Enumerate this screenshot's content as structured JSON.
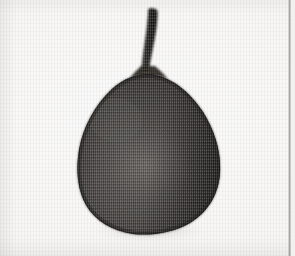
{
  "image": {
    "kind": "scanned-halftone-photograph",
    "subject": "pear-shaped-fruit-with-stem",
    "orientation": "portrait",
    "width_px": 295,
    "height_px": 256,
    "caption": "",
    "alt_text": "Dark pear-shaped fruit with a long curved stem, photographed against a plain pale background",
    "visible_text": []
  },
  "palette": {
    "paper_light": "#fbfafa",
    "paper_mid": "#f2f1ef",
    "paper_shadow": "#e6e5e3",
    "fruit_dark": "#2e2c2a",
    "fruit_mid": "#44413e",
    "fruit_light": "#565350",
    "fruit_edge": "#24221f",
    "stem_dark": "#1f1e1c",
    "stem_mid": "#3a3835",
    "seam_gray": "#8c8c8e"
  },
  "subject": {
    "body": {
      "label": "fruit-body",
      "left_px": 78,
      "right_px": 221,
      "top_px": 70,
      "bottom_px": 232,
      "center_x_px": 150,
      "center_y_px": 156,
      "shape": "broad rounded base tapering to a narrow shoulder"
    },
    "stem": {
      "label": "fruit-stem",
      "top_px": 8,
      "bottom_px": 76,
      "top_x_px": 153,
      "base_x_px": 145,
      "max_width_px": 9,
      "shape": "slightly curved, thicker and flared at the base"
    },
    "highlight": {
      "label": "surface-highlight",
      "center_x_px": 146,
      "center_y_px": 165,
      "radius_x_px": 42,
      "radius_y_px": 36
    },
    "shadow": {
      "label": "contact-shadow",
      "center_x_px": 150,
      "center_y_px": 231,
      "radius_x_px": 58,
      "radius_y_px": 7
    }
  },
  "artifacts": {
    "scan_seam": {
      "label": "page-edge-seam",
      "x_px": 289,
      "width_px": 2,
      "color": "#8c8c8e"
    },
    "halftone": {
      "label": "halftone-screen",
      "pattern": "fine vertical dot screen",
      "pitch_px": 2
    }
  }
}
